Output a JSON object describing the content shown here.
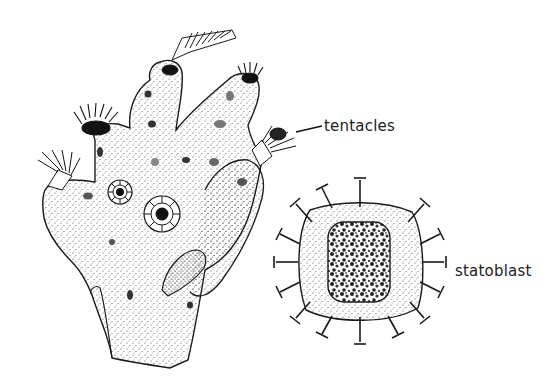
{
  "figure": {
    "labels": {
      "tentacles": "tentacles",
      "statoblast": "statoblast"
    },
    "colors": {
      "background": "#ffffff",
      "ink": "#1a1a1a",
      "stipple": "#444444"
    }
  }
}
